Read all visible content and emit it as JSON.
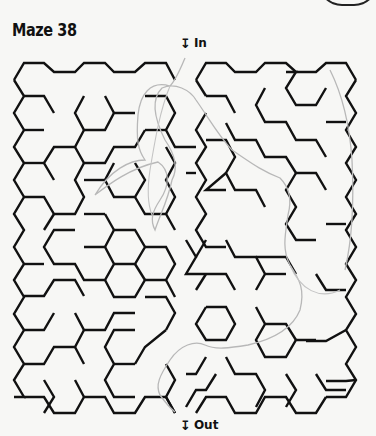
{
  "page": {
    "title": "Maze 38",
    "entry_label": "In",
    "exit_label": "Out",
    "entry_icon": "down-arrow-icon",
    "exit_icon": "down-arrow-icon"
  },
  "colors": {
    "background": "#f7f7f5",
    "maze_walls": "#111111",
    "solution_path": "#b5b5b5",
    "text": "#111111"
  },
  "maze": {
    "type": "hexagonal",
    "entry_position": "top-center",
    "exit_position": "bottom-center",
    "solution_drawn": true
  }
}
